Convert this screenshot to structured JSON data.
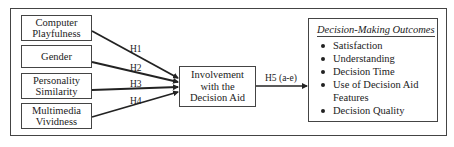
{
  "diagram": {
    "antecedents": [
      {
        "label": "Computer Playfulness"
      },
      {
        "label": "Gender"
      },
      {
        "label": "Personality Similarity"
      },
      {
        "label": "Multimedia Vividness"
      }
    ],
    "mediator": {
      "label": "Involvement with the Decision Aid"
    },
    "hypotheses": {
      "h1": "H1",
      "h2": "H2",
      "h3": "H3",
      "h4": "H4",
      "h5": "H5 (a-e)"
    },
    "outcomes": {
      "title": "Decision-Making Outcomes",
      "items": [
        "Satisfaction",
        "Understanding",
        "Decision Time",
        "Use of Decision Aid Features",
        "Decision Quality"
      ]
    }
  }
}
